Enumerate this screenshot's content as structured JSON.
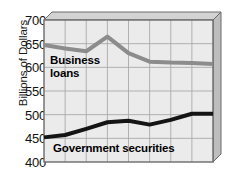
{
  "chart_data": {
    "type": "line",
    "title": "",
    "subtitle": "",
    "xlabel": "",
    "ylabel": "Billions of Dollars",
    "ylim": [
      400,
      700
    ],
    "yticks": [
      400,
      450,
      500,
      550,
      600,
      650,
      700
    ],
    "ytick_labels": [
      "400",
      "450",
      "500",
      "550",
      "600",
      "650",
      "700"
    ],
    "xlim": [
      0,
      8
    ],
    "x": [
      0,
      1,
      2,
      3,
      4,
      5,
      6,
      7,
      8
    ],
    "xtick_labels": [
      "",
      "",
      "",
      "",
      "",
      "",
      "",
      "",
      ""
    ],
    "grid": true,
    "grid_color": "#a9a9a9",
    "plot_bg": "#ebebeb",
    "legend": "inline-labels",
    "legend_position": "inline",
    "series": [
      {
        "name": "Business loans",
        "label": "Business\nloans",
        "color": "#8c8c8c",
        "line_width": 4,
        "values": [
          647,
          640,
          634,
          665,
          630,
          612,
          610,
          609,
          607
        ]
      },
      {
        "name": "Government securities",
        "label": "Government securities",
        "color": "#141414",
        "line_width": 4,
        "values": [
          452,
          457,
          470,
          484,
          487,
          479,
          489,
          502,
          502
        ]
      }
    ],
    "annotations": [
      {
        "name": "business-loans-inline-label",
        "text_line1": "Business",
        "text_line2": "loans"
      },
      {
        "name": "government-securities-inline-label",
        "text": "Government securities"
      }
    ]
  },
  "axis": {
    "y_title": "Billions of Dollars",
    "ticks": [
      "700",
      "650",
      "600",
      "550",
      "500",
      "450",
      "400"
    ]
  },
  "labels": {
    "business_line1": "Business",
    "business_line2": "loans",
    "government": "Government securities"
  },
  "colors": {
    "business_loans": "#8c8c8c",
    "government_securities": "#141414",
    "plot_background": "#ebebeb",
    "gridline": "#a9a9a9",
    "frame": "#6b6b6b",
    "bevel_top": "#d3d3d3",
    "bevel_side": "#bdbdbd",
    "text": "#111111"
  }
}
